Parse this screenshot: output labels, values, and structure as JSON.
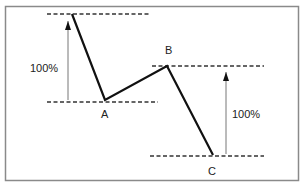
{
  "diagram": {
    "title": "",
    "points": [
      {
        "id": "start",
        "label": ""
      },
      {
        "id": "A",
        "label": "A"
      },
      {
        "id": "B",
        "label": "B"
      },
      {
        "id": "C",
        "label": "C"
      }
    ],
    "measurements": [
      {
        "id": "first-leg",
        "label": "100%",
        "from": "start",
        "to": "A"
      },
      {
        "id": "second-leg",
        "label": "100%",
        "from": "B",
        "to": "C"
      }
    ],
    "colors": {
      "line": "#111111",
      "dashed": "#333333",
      "arrow": "#555555",
      "frame": "#888888",
      "text": "#222222"
    }
  }
}
